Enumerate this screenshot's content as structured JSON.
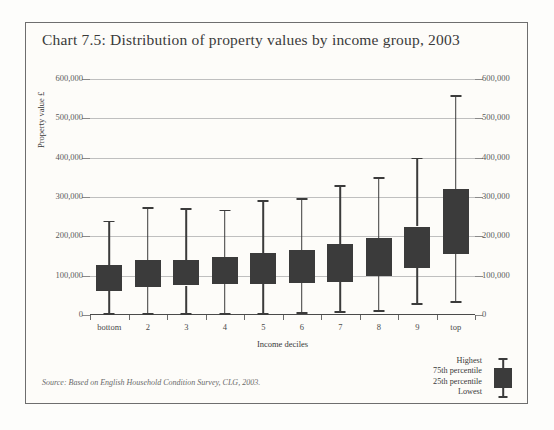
{
  "chart_data": {
    "type": "bar",
    "title": "Chart 7.5: Distribution of property values by income group, 2003",
    "xlabel": "Income deciles",
    "ylabel": "Property value £",
    "ylim": [
      0,
      600000
    ],
    "yticks": [
      "0",
      "100,000",
      "200,000",
      "300,000",
      "400,000",
      "500,000",
      "600,000"
    ],
    "ytick_values": [
      0,
      100000,
      200000,
      300000,
      400000,
      500000,
      600000
    ],
    "grid": true,
    "legend_position": "bottom-right",
    "categories": [
      "bottom",
      "2",
      "3",
      "4",
      "5",
      "6",
      "7",
      "8",
      "9",
      "top"
    ],
    "series": [
      {
        "name": "Lowest",
        "values": [
          5000,
          5000,
          5000,
          5000,
          5000,
          8000,
          10000,
          12000,
          30000,
          35000
        ]
      },
      {
        "name": "25th percentile",
        "values": [
          62000,
          72000,
          75000,
          78000,
          80000,
          82000,
          85000,
          98000,
          120000,
          155000
        ]
      },
      {
        "name": "75th percentile",
        "values": [
          128000,
          140000,
          140000,
          148000,
          158000,
          165000,
          180000,
          195000,
          225000,
          320000
        ]
      },
      {
        "name": "Highest",
        "values": [
          240000,
          275000,
          272000,
          268000,
          292000,
          298000,
          330000,
          350000,
          400000,
          560000
        ]
      }
    ],
    "annotations": [
      "Source: Based on English Household Condition Survey, CLG, 2003."
    ]
  },
  "legend": {
    "items": [
      "Highest",
      "75th percentile",
      "25th percentile",
      "Lowest"
    ]
  },
  "source_note": "Source: Based on English Household Condition Survey, CLG, 2003.",
  "axis": {
    "zero_left": "0",
    "zero_right": "0"
  },
  "colors": {
    "box_fill": "#3b3b3b",
    "gridline": "#bfbfbf",
    "frame": "#6e6e6e",
    "background": "#fdfcf9",
    "text": "#3a3a3a"
  }
}
